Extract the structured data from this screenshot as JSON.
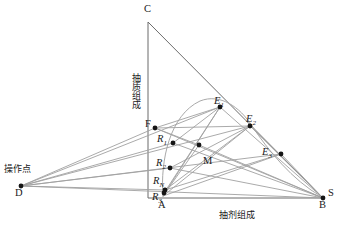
{
  "figure": {
    "type": "ternary-extraction-diagram",
    "axis_labels": {
      "vertical": "抽质组成",
      "horizontal": "抽剂组成"
    },
    "annotations": {
      "operating_point": "操作点"
    },
    "vertices": {
      "C": "C",
      "A": "A",
      "B": "B",
      "S": "S",
      "D": "D"
    },
    "points": [
      {
        "id": "C",
        "label": "C",
        "sub": "",
        "x": 148,
        "y": 22,
        "lx": 144,
        "ly": 4,
        "marker": false
      },
      {
        "id": "A",
        "label": "A",
        "sub": "",
        "x": 162,
        "y": 198,
        "lx": 158,
        "ly": 200,
        "marker": false
      },
      {
        "id": "B",
        "label": "B",
        "sub": "",
        "x": 323,
        "y": 198,
        "lx": 319,
        "ly": 200,
        "marker": true
      },
      {
        "id": "S",
        "label": "S",
        "sub": "",
        "x": 323,
        "y": 198,
        "lx": 328,
        "ly": 188,
        "marker": false
      },
      {
        "id": "D",
        "label": "D",
        "sub": "",
        "x": 21,
        "y": 186,
        "lx": 15,
        "ly": 188,
        "marker": true
      },
      {
        "id": "F",
        "label": "F",
        "sub": "",
        "x": 155,
        "y": 128,
        "lx": 145,
        "ly": 119,
        "marker": true
      },
      {
        "id": "E1",
        "label": "E",
        "sub": "1",
        "x": 220,
        "y": 107,
        "lx": 214,
        "ly": 96,
        "marker": true
      },
      {
        "id": "E2",
        "label": "E",
        "sub": "2",
        "x": 250,
        "y": 126,
        "lx": 246,
        "ly": 114,
        "marker": true
      },
      {
        "id": "E3",
        "label": "E",
        "sub": "3",
        "x": 281,
        "y": 154,
        "lx": 262,
        "ly": 147,
        "marker": true
      },
      {
        "id": "R1",
        "label": "R",
        "sub": "1",
        "x": 173,
        "y": 143,
        "lx": 157,
        "ly": 134,
        "marker": true
      },
      {
        "id": "R2",
        "label": "R",
        "sub": "2",
        "x": 170,
        "y": 168,
        "lx": 156,
        "ly": 158,
        "marker": true
      },
      {
        "id": "RN",
        "label": "R",
        "sub": "N",
        "x": 165,
        "y": 190,
        "lx": 153,
        "ly": 176,
        "marker": true
      },
      {
        "id": "R3",
        "label": "R",
        "sub": "3",
        "x": 164,
        "y": 193,
        "lx": 152,
        "ly": 192,
        "marker": true
      },
      {
        "id": "M",
        "label": "M",
        "sub": "",
        "x": 199,
        "y": 145,
        "lx": 203,
        "ly": 156,
        "marker": true
      }
    ],
    "colors": {
      "line": "#8c8c8c",
      "triangle": "#6b6b6b",
      "point": "#151515",
      "text": "#1a1a1a",
      "background": "#ffffff"
    }
  },
  "chart_data": {
    "type": "scatter",
    "title": "",
    "xlabel": "抽剂组成",
    "ylabel": "抽质组成",
    "annotations": [
      "操作点"
    ],
    "series": [
      {
        "name": "extract-phase",
        "points": [
          {
            "label": "E1",
            "x": 220,
            "y": 107
          },
          {
            "label": "E2",
            "x": 250,
            "y": 126
          },
          {
            "label": "E3",
            "x": 281,
            "y": 154
          }
        ]
      },
      {
        "name": "raffinate-phase",
        "points": [
          {
            "label": "R1",
            "x": 173,
            "y": 143
          },
          {
            "label": "R2",
            "x": 170,
            "y": 168
          },
          {
            "label": "RN",
            "x": 165,
            "y": 190
          },
          {
            "label": "R3",
            "x": 164,
            "y": 193
          }
        ]
      },
      {
        "name": "feed-and-mix",
        "points": [
          {
            "label": "F",
            "x": 155,
            "y": 128
          },
          {
            "label": "M",
            "x": 199,
            "y": 145
          }
        ]
      },
      {
        "name": "vertices",
        "points": [
          {
            "label": "C",
            "x": 148,
            "y": 22
          },
          {
            "label": "A",
            "x": 162,
            "y": 198
          },
          {
            "label": "B",
            "x": 323,
            "y": 198
          },
          {
            "label": "D",
            "x": 21,
            "y": 186
          }
        ]
      }
    ],
    "grid": false,
    "legend_position": "none"
  }
}
